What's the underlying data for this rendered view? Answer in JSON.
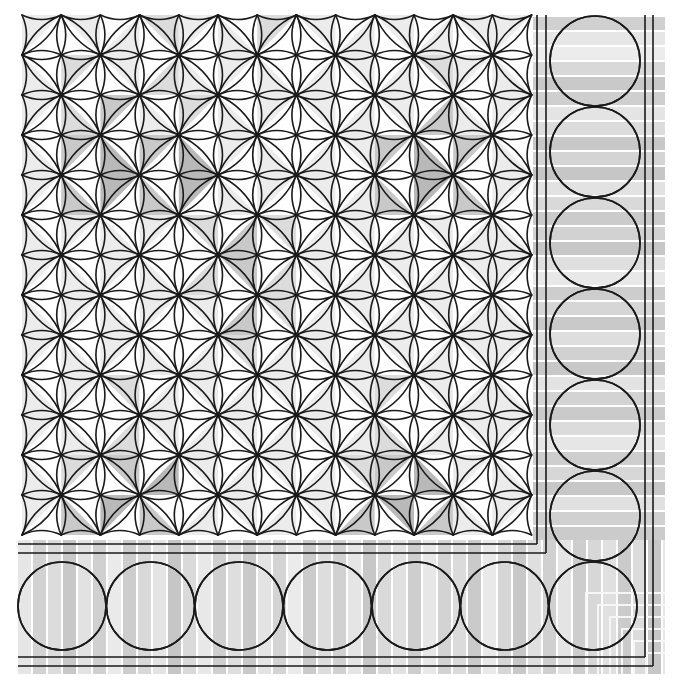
{
  "canvas": {
    "width": 674,
    "height": 689,
    "background": "#ffffff"
  },
  "colors": {
    "line": "#1a1a1a",
    "white": "#ffffff",
    "shades": [
      "#ffffff",
      "#ececec",
      "#dcdcdc",
      "#c9c9c9",
      "#b9b9b9"
    ],
    "stripe_gap": "#f8f8f8"
  },
  "main_grid": {
    "x0": 22,
    "y0": 15,
    "cols": 13,
    "rows": 13,
    "cell_w": 39.2,
    "cell_h": 40.0,
    "edge_lens_bulge": 4.5,
    "diag_lens_bulge": 5.5,
    "diagonal_rule": "(col+row) even => '/' ; odd => '\\'",
    "shading_note": "each row string: 13 cells, 2 chars per cell (upper/left triangle, lower/right triangle), digits index into colors.shades",
    "shading": [
      "10 10 01 20 10 01 20 10 01 10 01 10 10",
      "01 20 10 02 01 10 01 01 10 01 20 10 01",
      "10 02 30 01 20 01 10 10 01 10 03 01 10",
      "01 30 04 30 04 10 01 01 10 30 04 30 01",
      "10 03 40 03 40 01 10 10 01 03 40 03 10",
      "01 10 01 10 20 03 20 01 10 01 10 01 01",
      "10 01 10 01 02 30 02 10 01 10 01 10 10",
      "01 10 01 10 10 03 20 01 10 01 10 01 01",
      "10 01 10 01 01 20 01 10 01 10 01 10 10",
      "01 10 20 01 10 01 10 01 10 20 10 01 01",
      "10 01 02 10 01 10 01 10 01 02 01 10 10",
      "01 20 30 04 10 01 10 01 20 30 04 10 01",
      "10 03 40 03 01 10 01 10 03 40 03 01 10"
    ]
  },
  "inner_frame": {
    "vertical_x": [
      537,
      546
    ],
    "horizontal_y": [
      544,
      553
    ],
    "top_y": 15,
    "left_x": 18
  },
  "border": {
    "strip_left": 18,
    "strip_top": 17,
    "strip_right": 665,
    "strip_bottom": 674,
    "stripe_pitch": 15,
    "outer_frame": {
      "vertical_x": [
        645,
        653
      ],
      "horizontal_y": [
        657,
        666
      ]
    },
    "bottom_circles": {
      "cy": 606,
      "r": 44,
      "cx": [
        62,
        150.5,
        239,
        327.5,
        416,
        504.5,
        593
      ]
    },
    "right_circles": {
      "cx": 595,
      "r": 45,
      "cy": [
        61,
        152,
        243,
        334,
        425,
        516
      ]
    },
    "stripe_shades_bottom": [
      "#e6e6e6",
      "#d2d2d2",
      "#dcdcdc",
      "#c8c8c8",
      "#e2e2e2",
      "#d0d0d0",
      "#eaeaea",
      "#cdcdcd",
      "#d8d8d8",
      "#e4e4e4",
      "#c6c6c6",
      "#dadada",
      "#e8e8e8",
      "#cfcfcf",
      "#dedede",
      "#c9c9c9",
      "#e3e3e3",
      "#d4d4d4",
      "#ebebeb",
      "#cbcbcb",
      "#dddddd",
      "#d1d1d1",
      "#e5e5e5",
      "#c7c7c7",
      "#d9d9d9",
      "#e1e1e1",
      "#cecece",
      "#e7e7e7",
      "#d3d3d3",
      "#dbdbdb",
      "#cacaca",
      "#e9e9e9",
      "#d6d6d6",
      "#c8c8c8",
      "#dfdfdf",
      "#d0d0d0",
      "#e4e4e4",
      "#cdcdcd",
      "#d7d7d7",
      "#e0e0e0",
      "#cbcbcb",
      "#dcdcdc",
      "#c6c6c6"
    ],
    "stripe_shades_right": [
      "#d0d0d0",
      "#e6e6e6",
      "#ececec",
      "#d8d8d8",
      "#c9c9c9",
      "#cfcfcf",
      "#e4e4e4",
      "#dcdcdc",
      "#c8c8c8",
      "#d4d4d4",
      "#c6c6c6",
      "#e2e2e2",
      "#d9d9d9",
      "#cbcbcb",
      "#d2d2d2",
      "#c7c7c7",
      "#dfdfdf",
      "#e8e8e8",
      "#cdcdcd",
      "#d6d6d6",
      "#c9c9c9",
      "#dedede",
      "#d1d1d1",
      "#c8c8c8",
      "#e3e3e3",
      "#d3d3d3",
      "#cacaca",
      "#dbdbdb",
      "#e6e6e6",
      "#cecece",
      "#d7d7d7",
      "#c7c7c7",
      "#e0e0e0",
      "#d0d0d0",
      "#cbcbcb",
      "#dddddd",
      "#e9e9e9",
      "#d5d5d5",
      "#cacaca",
      "#dadada",
      "#cfcfcf",
      "#c6c6c6",
      "#e1e1e1",
      "#d3d3d3"
    ]
  }
}
